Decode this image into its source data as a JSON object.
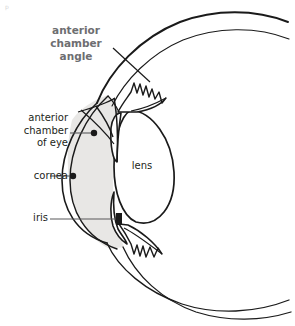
{
  "figure": {
    "kind": "anatomical-diagram",
    "corner_mark": "p",
    "title": {
      "line1": "anterior",
      "line2": "chamber",
      "line3": "angle",
      "color": "#6d6e71"
    },
    "labels": {
      "anterior_chamber": {
        "line1": "anterior",
        "line2": "chamber",
        "line3": "of eye"
      },
      "cornea": "cornea",
      "iris": "iris",
      "lens": "lens"
    },
    "colors": {
      "ink": "#1a1a1a",
      "title_gray": "#6d6e71",
      "label_ink": "#231f20",
      "leader_line": "#58595b",
      "chamber_fill": "#e8e7e5",
      "background": "#ffffff"
    },
    "leaders": [
      {
        "name": "anterior-chamber-leader",
        "x1": 70,
        "y1": 133,
        "x2": 92,
        "y2": 133,
        "dot_x": 94,
        "dot_y": 133
      },
      {
        "name": "cornea-leader",
        "x1": 50,
        "y1": 176,
        "x2": 71,
        "y2": 176,
        "dot_x": 73,
        "dot_y": 176
      },
      {
        "name": "iris-leader",
        "x1": 52,
        "y1": 219,
        "x2": 118,
        "y2": 219,
        "dot_x": 121,
        "dot_y": 219
      },
      {
        "name": "angle-leader",
        "x1": 112,
        "y1": 48,
        "x2": 148,
        "y2": 80
      }
    ],
    "parts": [
      "sclera",
      "cornea",
      "anterior-chamber",
      "iris",
      "lens",
      "ciliary-body",
      "anterior-chamber-angle"
    ]
  }
}
